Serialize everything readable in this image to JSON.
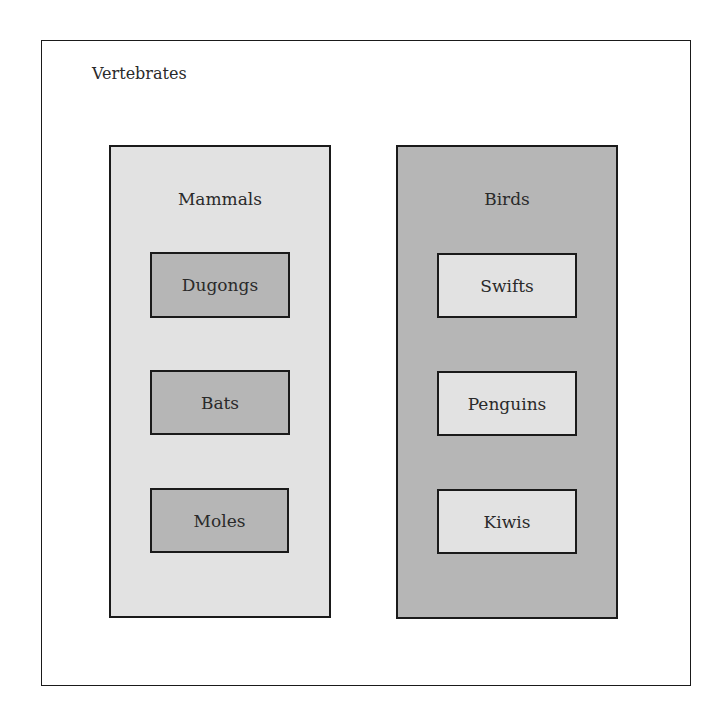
{
  "diagram": {
    "title": "Vertebrates",
    "groups": [
      {
        "label": "Mammals",
        "fill": "#e2e2e2",
        "children": [
          {
            "label": "Dugongs",
            "fill": "#b6b6b6"
          },
          {
            "label": "Bats",
            "fill": "#b6b6b6"
          },
          {
            "label": "Moles",
            "fill": "#b6b6b6"
          }
        ]
      },
      {
        "label": "Birds",
        "fill": "#b6b6b6",
        "children": [
          {
            "label": "Swifts",
            "fill": "#e2e2e2"
          },
          {
            "label": "Penguins",
            "fill": "#e2e2e2"
          },
          {
            "label": "Kiwis",
            "fill": "#e2e2e2"
          }
        ]
      }
    ]
  }
}
